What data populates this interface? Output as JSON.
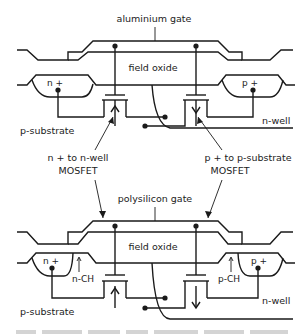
{
  "diagram": {
    "top": {
      "gate_label": "aluminium gate",
      "oxide_label": "field oxide",
      "n_plus_label": "n +",
      "p_plus_label": "p +",
      "substrate_label": "p-substrate",
      "well_label": "n-well"
    },
    "middle": {
      "left_callout_line1": "n +  to n-well",
      "left_callout_line2": "MOSFET",
      "right_callout_line1": "p +  to p-substrate",
      "right_callout_line2": "MOSFET"
    },
    "bottom": {
      "gate_label": "polysilicon gate",
      "oxide_label": "field oxide",
      "n_plus_label": "n +",
      "p_plus_label": "p +",
      "n_channel_label": "n-CH",
      "p_channel_label": "p-CH",
      "substrate_label": "p-substrate",
      "well_label": "n-well"
    },
    "colors": {
      "ink": "#1a1a1a",
      "background": "#ffffff"
    }
  }
}
